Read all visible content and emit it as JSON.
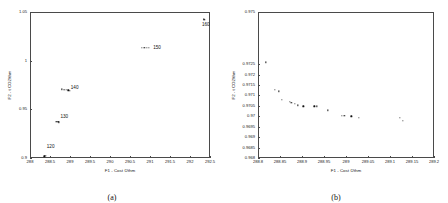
{
  "figure": {
    "panel_a": {
      "caption": "(a)",
      "xlabel": "F1 - Cost €/thm",
      "ylabel": "F2 - t CO2/thm"
    },
    "panel_b": {
      "caption": "(b)",
      "xlabel": "F1 - Cost €/thm",
      "ylabel": "F2 - t CO2/thm"
    }
  },
  "chart_data": [
    {
      "type": "scatter",
      "panel": "a",
      "title": "",
      "xlabel": "F1 - Cost €/thm",
      "ylabel": "F2 - t CO2/thm",
      "xlim": [
        288.0,
        292.5
      ],
      "ylim": [
        0.9,
        1.05
      ],
      "xticks": [
        "288",
        "288.5",
        "289",
        "289.5",
        "290",
        "290.5",
        "291",
        "291.5",
        "292",
        "292.5"
      ],
      "xtick_values": [
        288,
        288.5,
        289,
        289.5,
        290,
        290.5,
        291,
        291.5,
        292,
        292.5
      ],
      "yticks": [
        "0.9",
        "0.95",
        "1",
        "1.05"
      ],
      "ytick_values": [
        0.9,
        0.95,
        1.0,
        1.05
      ],
      "grid": false,
      "legend": "none",
      "annotations": [
        "120",
        "130",
        "140",
        "150",
        "160"
      ],
      "clusters": [
        {
          "label": "120",
          "label_x": 288.42,
          "label_y": 0.9115,
          "points": [
            [
              288.36,
              0.9018
            ],
            [
              288.38,
              0.9022
            ],
            [
              288.4,
              0.9025
            ]
          ]
        },
        {
          "label": "130",
          "label_x": 288.76,
          "label_y": 0.9425,
          "points": [
            [
              288.66,
              0.9375
            ],
            [
              288.69,
              0.9371
            ],
            [
              288.71,
              0.9368
            ],
            [
              288.73,
              0.9365
            ]
          ]
        },
        {
          "label": "140",
          "label_x": 289.02,
          "label_y": 0.9715,
          "points": [
            [
              288.8,
              0.9705
            ],
            [
              288.84,
              0.9702
            ],
            [
              288.88,
              0.97
            ],
            [
              288.92,
              0.9697
            ],
            [
              288.96,
              0.9694
            ],
            [
              289.0,
              0.9691
            ]
          ]
        },
        {
          "label": "150",
          "label_x": 291.08,
          "label_y": 1.013,
          "points": [
            [
              290.8,
              1.0135
            ],
            [
              290.86,
              1.0133
            ],
            [
              290.92,
              1.0131
            ],
            [
              290.98,
              1.0129
            ]
          ]
        },
        {
          "label": "160",
          "label_x": 292.3,
          "label_y": 1.0365,
          "points": [
            [
              292.34,
              1.0425
            ],
            [
              292.36,
              1.0422
            ]
          ]
        }
      ]
    },
    {
      "type": "scatter",
      "panel": "b",
      "title": "",
      "xlabel": "F1 - Cost €/thm",
      "ylabel": "F2 - t CO2/thm",
      "xlim": [
        288.8,
        289.2
      ],
      "ylim": [
        0.968,
        0.975
      ],
      "xticks": [
        "288.8",
        "288.85",
        "288.9",
        "288.95",
        "289",
        "289.05",
        "289.1",
        "289.15",
        "289.2"
      ],
      "xtick_values": [
        288.8,
        288.85,
        288.9,
        288.95,
        289.0,
        289.05,
        289.1,
        289.15,
        289.2
      ],
      "yticks": [
        "0.968",
        "0.9685",
        "0.969",
        "0.9695",
        "0.97",
        "0.9705",
        "0.971",
        "0.9715",
        "0.972",
        "0.9725",
        "0.975"
      ],
      "ytick_values": [
        0.968,
        0.9685,
        0.969,
        0.9695,
        0.97,
        0.9705,
        0.971,
        0.9715,
        0.972,
        0.9725,
        0.975
      ],
      "grid": false,
      "legend": "none",
      "points": [
        [
          288.818,
          0.97258
        ],
        [
          288.838,
          0.97128
        ],
        [
          288.848,
          0.9712
        ],
        [
          288.855,
          0.9708
        ],
        [
          288.872,
          0.97068
        ],
        [
          288.876,
          0.97064
        ],
        [
          288.884,
          0.97058
        ],
        [
          288.89,
          0.97052
        ],
        [
          288.903,
          0.97048
        ],
        [
          288.928,
          0.97048
        ],
        [
          288.934,
          0.97048
        ],
        [
          288.958,
          0.97028
        ],
        [
          288.99,
          0.97002
        ],
        [
          288.996,
          0.97002
        ],
        [
          289.012,
          0.97
        ],
        [
          289.03,
          0.96992
        ],
        [
          289.122,
          0.96992
        ],
        [
          289.13,
          0.96978
        ]
      ]
    }
  ]
}
